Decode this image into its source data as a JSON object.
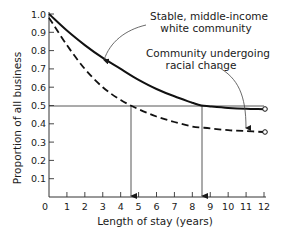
{
  "chart_data": {
    "type": "line",
    "title": "",
    "xlabel": "Length of stay (years)",
    "ylabel": "Proportion of all business",
    "xlim": [
      0,
      12
    ],
    "ylim": [
      0,
      1.0
    ],
    "x_ticks": [
      "0",
      "1",
      "2",
      "3",
      "4",
      "5",
      "6",
      "7",
      "8",
      "9",
      "10",
      "11",
      "12"
    ],
    "y_ticks": [
      "0.1",
      "0.2",
      "0.3",
      "0.4",
      "0.5",
      "0.6",
      "0.7",
      "0.8",
      "0.9",
      "1.0"
    ],
    "grid": false,
    "legend": "annotations",
    "x": [
      0,
      1,
      2,
      3,
      4,
      5,
      6,
      7,
      8,
      8.5,
      9,
      10,
      11,
      12
    ],
    "series": [
      {
        "name": "Stable, middle-income white community",
        "style": "solid",
        "values": [
          1.0,
          0.91,
          0.83,
          0.76,
          0.7,
          0.64,
          0.59,
          0.55,
          0.515,
          0.5,
          0.495,
          0.487,
          0.482,
          0.48
        ]
      },
      {
        "name": "Community undergoing racial change",
        "style": "dashed",
        "values": [
          0.98,
          0.83,
          0.7,
          0.6,
          0.53,
          0.48,
          0.44,
          0.41,
          0.385,
          0.38,
          0.375,
          0.365,
          0.36,
          0.355
        ]
      }
    ],
    "reference_line": {
      "y": 0.5,
      "label": "0.5"
    },
    "drop_lines": [
      {
        "series": "Community undergoing racial change",
        "x": 4.5,
        "y": 0.5
      },
      {
        "series": "Stable, middle-income white community",
        "x": 8.5,
        "y": 0.5
      }
    ],
    "annotations": [
      {
        "text_lines": [
          "Stable, middle-income",
          "white community"
        ],
        "points_to": "solid curve near x=3"
      },
      {
        "text_lines": [
          "Community undergoing",
          "racial change"
        ],
        "points_to": "dashed curve near x=11"
      }
    ]
  },
  "labels": {
    "y_axis": "Proportion of all business",
    "x_axis": "Length of stay (years)",
    "annotation_stable_1": "Stable, middle-income",
    "annotation_stable_2": "white community",
    "annotation_change_1": "Community undergoing",
    "annotation_change_2": "racial change"
  }
}
